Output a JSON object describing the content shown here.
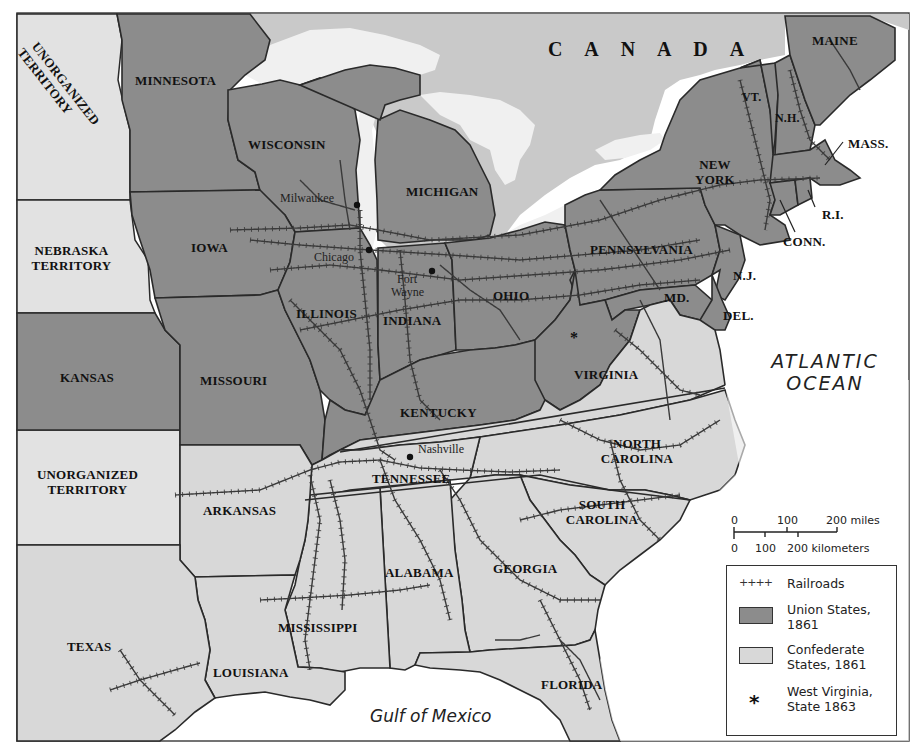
{
  "map": {
    "title_region": "CANADA",
    "colors": {
      "union": "#8c8c8c",
      "confederate": "#d8d8d8",
      "territory": "#e2e2e2",
      "canada": "#c9c9c9",
      "water": "#f0f0f0",
      "border": "#2a2a2a",
      "railroad": "#3a3a3a"
    },
    "union_states": [
      {
        "name": "MINNESOTA"
      },
      {
        "name": "WISCONSIN"
      },
      {
        "name": "MICHIGAN"
      },
      {
        "name": "IOWA"
      },
      {
        "name": "KANSAS"
      },
      {
        "name": "MISSOURI"
      },
      {
        "name": "ILLINOIS"
      },
      {
        "name": "INDIANA"
      },
      {
        "name": "OHIO"
      },
      {
        "name": "KENTUCKY"
      },
      {
        "name": "PENNSYLVANIA"
      },
      {
        "name": "NEW YORK"
      },
      {
        "name": "VT."
      },
      {
        "name": "N.H."
      },
      {
        "name": "MAINE"
      },
      {
        "name": "MASS."
      },
      {
        "name": "R.I."
      },
      {
        "name": "CONN."
      },
      {
        "name": "N.J."
      },
      {
        "name": "DEL."
      },
      {
        "name": "MD."
      }
    ],
    "confederate_states": [
      {
        "name": "VIRGINIA"
      },
      {
        "name": "NORTH CAROLINA"
      },
      {
        "name": "SOUTH CAROLINA"
      },
      {
        "name": "TENNESSEE"
      },
      {
        "name": "ARKANSAS"
      },
      {
        "name": "GEORGIA"
      },
      {
        "name": "ALABAMA"
      },
      {
        "name": "MISSISSIPPI"
      },
      {
        "name": "LOUISIANA"
      },
      {
        "name": "FLORIDA"
      },
      {
        "name": "TEXAS"
      }
    ],
    "territories": [
      {
        "name": "UNORGANIZED TERRITORY",
        "position": "northwest"
      },
      {
        "name": "NEBRASKA TERRITORY"
      },
      {
        "name": "UNORGANIZED TERRITORY",
        "position": "southwest"
      }
    ],
    "labels": {
      "canada": "C A N A D A",
      "unorganized_nw_1": "UNORGANIZED",
      "unorganized_nw_2": "TERRITORY",
      "minnesota": "MINNESOTA",
      "wisconsin": "WISCONSIN",
      "michigan": "MICHIGAN",
      "iowa": "IOWA",
      "nebraska_1": "NEBRASKA",
      "nebraska_2": "TERRITORY",
      "kansas": "KANSAS",
      "missouri": "MISSOURI",
      "illinois": "ILLINOIS",
      "indiana": "INDIANA",
      "ohio": "OHIO",
      "kentucky": "KENTUCKY",
      "pennsylvania": "PENNSYLVANIA",
      "new_york_1": "NEW",
      "new_york_2": "YORK",
      "maine": "MAINE",
      "vt": "VT.",
      "nh": "N.H.",
      "mass": "MASS.",
      "ri": "R.I.",
      "conn": "CONN.",
      "nj": "N.J.",
      "md": "MD.",
      "del": "DEL.",
      "virginia": "VIRGINIA",
      "north_carolina_1": "NORTH",
      "north_carolina_2": "CAROLINA",
      "south_carolina_1": "SOUTH",
      "south_carolina_2": "CAROLINA",
      "tennessee": "TENNESSEE",
      "arkansas": "ARKANSAS",
      "unorganized_sw_1": "UNORGANIZED",
      "unorganized_sw_2": "TERRITORY",
      "alabama": "ALABAMA",
      "georgia": "GEORGIA",
      "mississippi": "MISSISSIPPI",
      "louisiana": "LOUISIANA",
      "texas": "TEXAS",
      "florida": "FLORIDA"
    },
    "cities": [
      {
        "name": "Milwaukee"
      },
      {
        "name": "Chicago"
      },
      {
        "name": "Fort Wayne",
        "line1": "Fort",
        "line2": "Wayne"
      },
      {
        "name": "Nashville"
      }
    ],
    "water_labels": {
      "atlantic_1": "ATLANTIC",
      "atlantic_2": "OCEAN",
      "gulf": "Gulf of Mexico"
    },
    "west_virginia_marker": "*"
  },
  "scale_bar": {
    "miles_ticks": [
      "0",
      "100",
      "200 miles"
    ],
    "km_ticks": [
      "0",
      "100",
      "200 kilometers"
    ]
  },
  "legend": {
    "items": [
      {
        "symbol": "railroad-icon",
        "glyph": "++++",
        "label": "Railroads"
      },
      {
        "symbol": "union-swatch",
        "label_1": "Union States,",
        "label_2": "1861"
      },
      {
        "symbol": "confederate-swatch",
        "label_1": "Confederate",
        "label_2": "States, 1861"
      },
      {
        "symbol": "star-icon",
        "glyph": "*",
        "label_1": "West Virginia,",
        "label_2": "State 1863"
      }
    ]
  }
}
